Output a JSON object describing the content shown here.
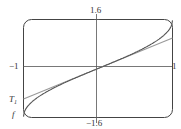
{
  "chart_data": {
    "type": "line",
    "title": "",
    "xlabel": "",
    "ylabel": "",
    "xlim": [
      -1,
      1
    ],
    "ylim": [
      -1.6,
      1.6
    ],
    "grid": false,
    "tick_labels": {
      "x_left": "−1",
      "x_right": "1",
      "y_top": "1.6",
      "y_bottom": "−1.6"
    },
    "series": [
      {
        "name": "f",
        "label": "f",
        "description": "arcsin(x)",
        "x": [
          -1,
          -0.9,
          -0.75,
          -0.5,
          -0.25,
          0,
          0.25,
          0.5,
          0.75,
          0.9,
          1
        ],
        "values": [
          -1.571,
          -1.12,
          -0.848,
          -0.524,
          -0.253,
          0,
          0.253,
          0.524,
          0.848,
          1.12,
          1.571
        ]
      },
      {
        "name": "T1",
        "label": "T",
        "label_sub": "1",
        "description": "Taylor polynomial (linear)",
        "x": [
          -1,
          1
        ],
        "values": [
          -1,
          1
        ]
      }
    ],
    "annotations": [
      {
        "text": "T1",
        "position": "left, near y=-0.95"
      },
      {
        "text": "f",
        "position": "bottom-left corner"
      }
    ]
  },
  "labels": {
    "y_top": "1.6",
    "y_bottom": "−1.6",
    "x_left": "−1",
    "x_right": "1",
    "t1_main": "T",
    "t1_sub": "1",
    "f": "f"
  },
  "colors": {
    "frame": "#444444",
    "f_curve": "#666666",
    "t1_curve": "#999999"
  }
}
